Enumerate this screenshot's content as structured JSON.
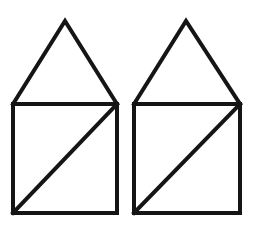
{
  "figure": {
    "name": "two-identical-house-shapes",
    "canvas": {
      "width": 255,
      "height": 226,
      "background_color": "#ffffff"
    },
    "style": {
      "stroke_color": "#151515",
      "stroke_width": 4,
      "fill": "none"
    },
    "shapes": [
      {
        "id": "left-house",
        "label": "Left house figure",
        "square": {
          "left": 13,
          "top": 104,
          "right": 117,
          "bottom": 213,
          "width": 104,
          "height": 109,
          "points": "13,104 117,104 117,213 13,213"
        },
        "diagonal": {
          "from_x": 13,
          "from_y": 213,
          "to_x": 117,
          "to_y": 104,
          "direction": "bottom-left-to-top-right"
        },
        "triangle": {
          "apex_x": 65,
          "apex_y": 21,
          "base_left_x": 13,
          "base_left_y": 104,
          "base_right_x": 117,
          "base_right_y": 104,
          "points": "13,104 65,21 117,104"
        }
      },
      {
        "id": "right-house",
        "label": "Right house figure",
        "square": {
          "left": 134,
          "top": 104,
          "right": 240,
          "bottom": 213,
          "width": 106,
          "height": 109,
          "points": "134,104 240,104 240,213 134,213"
        },
        "diagonal": {
          "from_x": 134,
          "from_y": 213,
          "to_x": 240,
          "to_y": 104,
          "direction": "bottom-left-to-top-right"
        },
        "triangle": {
          "apex_x": 186,
          "apex_y": 21,
          "base_left_x": 134,
          "base_left_y": 104,
          "base_right_x": 240,
          "base_right_y": 104,
          "points": "134,104 186,21 240,104"
        }
      }
    ]
  }
}
